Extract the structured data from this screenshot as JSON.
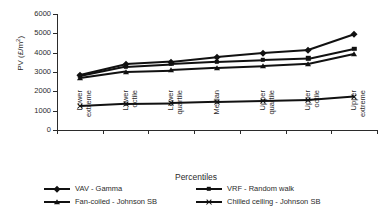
{
  "chart_data": {
    "type": "line",
    "title": "",
    "xlabel": "Percentiles",
    "ylabel": "PV (£/m2)",
    "ylabel_base": "PV (£/m",
    "ylabel_sup": "2",
    "ylabel_close": ")",
    "categories": [
      "Lower extreme",
      "Lower octile",
      "Lower quartile",
      "Median",
      "Upper quartile",
      "Upper octile",
      "Upper extreme"
    ],
    "category_lines": [
      [
        "Lower",
        "extreme"
      ],
      [
        "Lower",
        "octile"
      ],
      [
        "Lower",
        "quartile"
      ],
      [
        "Median",
        ""
      ],
      [
        "Upper",
        "quartile"
      ],
      [
        "Upper",
        "octile"
      ],
      [
        "Upper",
        "extreme"
      ]
    ],
    "ylim": [
      0,
      6000
    ],
    "yticks": [
      0,
      1000,
      2000,
      3000,
      4000,
      5000,
      6000
    ],
    "ytick_labels": [
      "0",
      "1000",
      "2000",
      "3000",
      "4000",
      "5000",
      "6000"
    ],
    "grid": false,
    "legend_position": "bottom",
    "series": [
      {
        "name": "VAV - Gamma",
        "marker": "diamond",
        "values": [
          2840,
          3400,
          3530,
          3780,
          3990,
          4140,
          4950
        ]
      },
      {
        "name": "VRF - Random walk",
        "marker": "square",
        "values": [
          2790,
          3280,
          3410,
          3530,
          3620,
          3700,
          4210
        ]
      },
      {
        "name": "Fan-coiled - Johnson SB",
        "marker": "triangle",
        "values": [
          2680,
          3020,
          3090,
          3210,
          3300,
          3420,
          3940
        ]
      },
      {
        "name": "Chilled ceiling - Johnson SB",
        "marker": "x",
        "values": [
          1250,
          1360,
          1380,
          1440,
          1490,
          1540,
          1720
        ]
      }
    ],
    "colors": {
      "line": "#111111",
      "axis": "#2b2b2b",
      "background": "#ffffff"
    }
  }
}
